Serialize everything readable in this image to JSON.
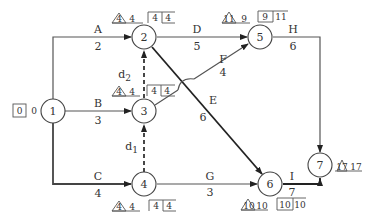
{
  "diagram": {
    "type": "double-code network (activity-on-arrow)",
    "colors": {
      "line": "#555555",
      "critical": "#222222",
      "text": "#333333",
      "background": "#ffffff"
    },
    "nodes": [
      {
        "id": "1",
        "label": "1",
        "et": "0",
        "lt": "0",
        "format": "box"
      },
      {
        "id": "2",
        "label": "2",
        "tri": "4",
        "tri_val": "4",
        "box_a": "4",
        "box_b": "4"
      },
      {
        "id": "3",
        "label": "3",
        "tri": "4",
        "tri_val": "4",
        "box_a": "4",
        "box_b": "4"
      },
      {
        "id": "4",
        "label": "4",
        "tri": "4",
        "tri_val": "4",
        "box_a": "4",
        "box_b": "4"
      },
      {
        "id": "5",
        "label": "5",
        "tri": "11",
        "tri_val": "9",
        "box_a": "9",
        "box_b": "11"
      },
      {
        "id": "6",
        "label": "6",
        "tri": "10",
        "tri_val": "10",
        "box_a": "10",
        "box_b": "10"
      },
      {
        "id": "7",
        "label": "7",
        "tri": "17",
        "tri_val": "17"
      }
    ],
    "activities": [
      {
        "name": "A",
        "duration": "2",
        "from": "1",
        "to": "2"
      },
      {
        "name": "B",
        "duration": "3",
        "from": "1",
        "to": "3"
      },
      {
        "name": "C",
        "duration": "4",
        "from": "1",
        "to": "4"
      },
      {
        "name": "D",
        "duration": "5",
        "from": "2",
        "to": "5"
      },
      {
        "name": "E",
        "duration": "6",
        "from": "2",
        "to": "6"
      },
      {
        "name": "F",
        "duration": "4",
        "from": "3",
        "to": "5"
      },
      {
        "name": "G",
        "duration": "3",
        "from": "4",
        "to": "6"
      },
      {
        "name": "H",
        "duration": "6",
        "from": "5",
        "to": "7"
      },
      {
        "name": "I",
        "duration": "7",
        "from": "6",
        "to": "7"
      }
    ],
    "dummies": [
      {
        "name": "d",
        "sub": "2",
        "from": "3",
        "to": "2"
      },
      {
        "name": "d",
        "sub": "1",
        "from": "4",
        "to": "3"
      }
    ]
  }
}
